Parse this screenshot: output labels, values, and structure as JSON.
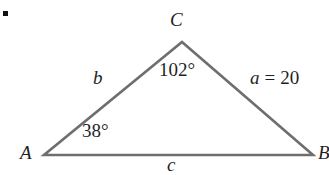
{
  "figure": {
    "type": "triangle-diagram",
    "background_color": "#ffffff",
    "stroke_color": "#6e6e6e",
    "text_color": "#1f1f1f",
    "bullet": {
      "name": "bullet-marker",
      "shape": "square",
      "color": "#111111"
    },
    "vertices": [
      {
        "label": "C",
        "x": 182,
        "y": 42
      },
      {
        "label": "A",
        "x": 44,
        "y": 155
      },
      {
        "label": "B",
        "x": 313,
        "y": 155
      }
    ],
    "sides": [
      {
        "label": "b",
        "between": "A-C"
      },
      {
        "label": "a",
        "between": "C-B",
        "measure": "a = 20",
        "variable": "a",
        "equals": "=",
        "value": "20"
      },
      {
        "label": "c",
        "between": "A-B"
      }
    ],
    "angles": [
      {
        "at": "C",
        "label": "102°",
        "value": 102
      },
      {
        "at": "A",
        "label": "38°",
        "value": 38
      }
    ]
  }
}
